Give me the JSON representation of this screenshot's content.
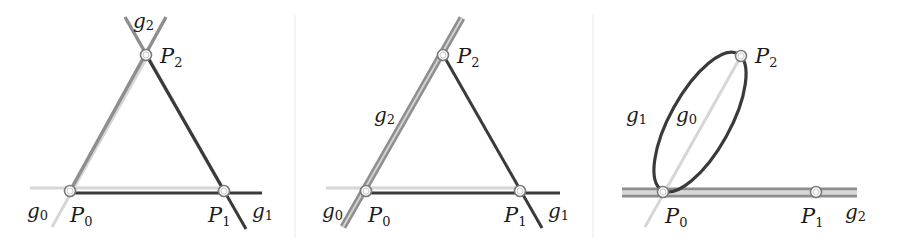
{
  "colors": {
    "g0": "#cfcfcf",
    "g1": "#3a3a3a",
    "g2": "#8c8c8c",
    "point_ring": "#7a7a7a",
    "separator": "#ececec"
  },
  "panels": [
    {
      "id": "panel-1",
      "points": [
        {
          "name": "P",
          "sub": "0"
        },
        {
          "name": "P",
          "sub": "1"
        },
        {
          "name": "P",
          "sub": "2"
        }
      ],
      "lines": [
        {
          "name": "g",
          "sub": "0"
        },
        {
          "name": "g",
          "sub": "1"
        },
        {
          "name": "g",
          "sub": "2"
        }
      ]
    },
    {
      "id": "panel-2",
      "points": [
        {
          "name": "P",
          "sub": "0"
        },
        {
          "name": "P",
          "sub": "1"
        },
        {
          "name": "P",
          "sub": "2"
        }
      ],
      "lines": [
        {
          "name": "g",
          "sub": "0"
        },
        {
          "name": "g",
          "sub": "1"
        },
        {
          "name": "g",
          "sub": "2"
        }
      ]
    },
    {
      "id": "panel-3",
      "points": [
        {
          "name": "P",
          "sub": "0"
        },
        {
          "name": "P",
          "sub": "1"
        },
        {
          "name": "P",
          "sub": "2"
        }
      ],
      "lines": [
        {
          "name": "g",
          "sub": "0"
        },
        {
          "name": "g",
          "sub": "1"
        },
        {
          "name": "g",
          "sub": "2"
        }
      ]
    }
  ]
}
